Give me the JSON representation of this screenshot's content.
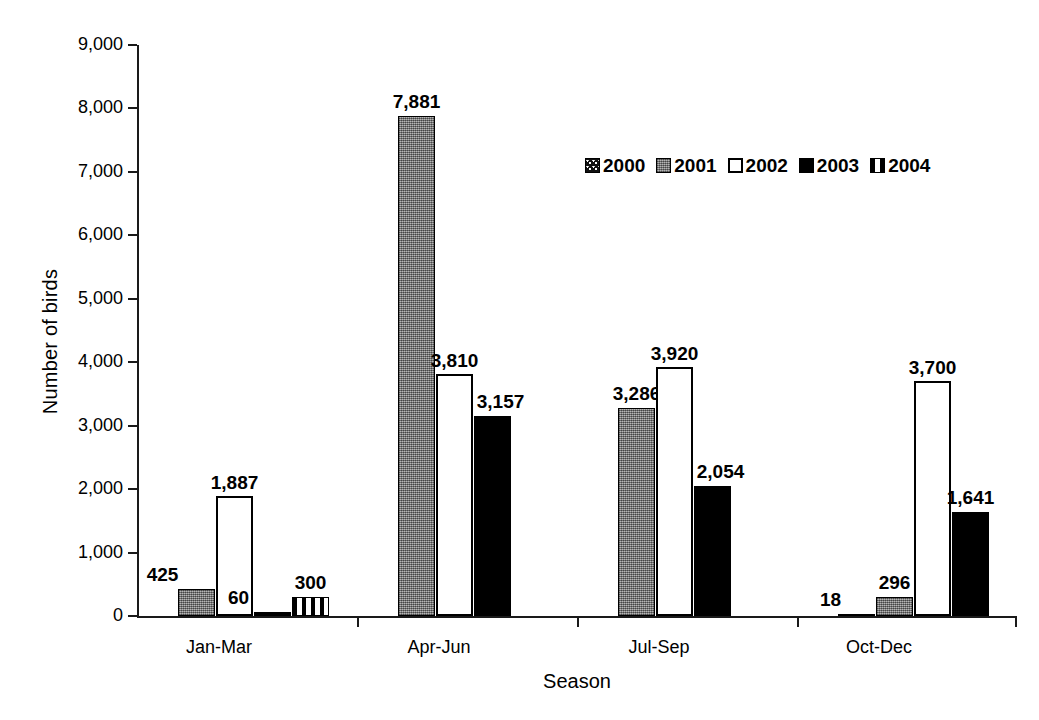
{
  "chart_data": {
    "type": "bar",
    "title": "",
    "xlabel": "Season",
    "ylabel": "Number of birds",
    "categories": [
      "Jan-Mar",
      "Apr-Jun",
      "Jul-Sep",
      "Oct-Dec"
    ],
    "ylim": [
      0,
      9000
    ],
    "ytick_values": [
      0,
      1000,
      2000,
      3000,
      4000,
      5000,
      6000,
      7000,
      8000,
      9000
    ],
    "ytick_labels": [
      "0",
      "1,000",
      "2,000",
      "3,000",
      "4,000",
      "5,000",
      "6,000",
      "7,000",
      "8,000",
      "9,000"
    ],
    "grid": false,
    "legend_position": "upper-center-right",
    "series": [
      {
        "name": "2000",
        "swatch": "dark-speckled",
        "values": [
          null,
          null,
          null,
          18
        ],
        "labels": [
          "",
          "",
          "",
          "18"
        ]
      },
      {
        "name": "2001",
        "swatch": "gray",
        "values": [
          425,
          7881,
          3286,
          296
        ],
        "labels": [
          "425",
          "7,881",
          "3,286",
          "296"
        ]
      },
      {
        "name": "2002",
        "swatch": "white-outline",
        "values": [
          1887,
          3810,
          3920,
          3700
        ],
        "labels": [
          "1,887",
          "3,810",
          "3,920",
          "3,700"
        ]
      },
      {
        "name": "2003",
        "swatch": "black",
        "values": [
          60,
          3157,
          2054,
          1641
        ],
        "labels": [
          "60",
          "3,157",
          "2,054",
          "1,641"
        ]
      },
      {
        "name": "2004",
        "swatch": "vertical-stripes",
        "values": [
          300,
          null,
          null,
          null
        ],
        "labels": [
          "300",
          "",
          "",
          ""
        ]
      }
    ]
  },
  "colors": {
    "axis": "#1a1a1a",
    "series_2000": "#111111",
    "series_2001": "#8a8a8a",
    "series_2002": "#ffffff",
    "series_2003": "#000000",
    "series_2004": "#000000",
    "background": "#ffffff"
  }
}
